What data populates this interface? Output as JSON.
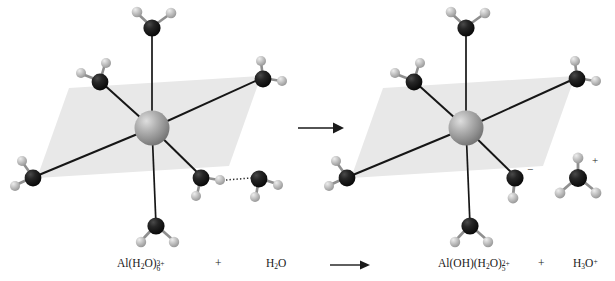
{
  "figure": {
    "background_color": "#ffffff",
    "plane_color": "#e8e8e8",
    "bond_color": "#161616",
    "oxygen_color": "#1c1c1c",
    "hydrogen_color": "#b9b9b9",
    "aluminum_color": "#9a9a9a",
    "text_color": "#1a1a1a"
  },
  "equation": {
    "reactant_complex": {
      "formula_prefix": "Al(H",
      "sub_1": "2",
      "mid": "O)",
      "sub_2": "6",
      "sup_2": "3+",
      "full_text": "Al(H2O)6 3+"
    },
    "plus_left_label": "+",
    "reactant_water": {
      "formula_prefix": "H",
      "sub_1": "2",
      "suffix": "O",
      "full_text": "H2O"
    },
    "bottom_arrow_label": "⟶",
    "product_complex": {
      "formula_prefix": "Al(OH)(H",
      "sub_1": "2",
      "mid": "O)",
      "sub_2": "5",
      "sup_2": "2+",
      "full_text": "Al(OH)(H2O)5 2+"
    },
    "plus_right_label": "+",
    "product_hydronium": {
      "formula_prefix": "H",
      "sub_1": "3",
      "suffix": "O",
      "sup_1": "+",
      "full_text": "H3O+"
    }
  },
  "main_arrow": {
    "label": "→",
    "description": "reaction arrow between the two molecular models"
  },
  "charges": {
    "hydroxide_minus": "−",
    "hydronium_plus": "+"
  },
  "left_model": {
    "name": "hexaaquaaluminium-ion-model",
    "center_atom": "Al",
    "ligand_count": 6,
    "free_water_label": "H2O",
    "hydrogen_bond": "dotted"
  },
  "right_model": {
    "name": "pentaaquahydroxoaluminium-ion-model",
    "center_atom": "Al",
    "ligand_count": 6,
    "hydroxide_label": "OH",
    "hydronium_label": "H3O+"
  }
}
